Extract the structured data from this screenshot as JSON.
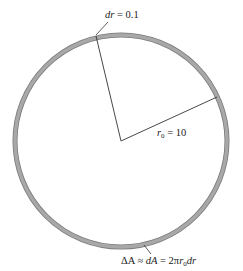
{
  "diagram": {
    "type": "annular ring (circle with thin shaded band) and two radii",
    "colors": {
      "ring_fill": "#a6a6a6",
      "ring_edge": "#7a7a7a",
      "line": "#333333",
      "background": "#ffffff"
    },
    "circle": {
      "center": [
        121,
        141
      ],
      "radius": 106,
      "ring_width": 4
    },
    "labels": {
      "dr": {
        "var": "dr",
        "eq": " = 0.1"
      },
      "r0": {
        "var": "r",
        "sub": "0",
        "eq": " = 10"
      },
      "area": {
        "delta": "ΔA",
        "approx": " ≈ ",
        "dA": "dA",
        "eq": " = 2π",
        "r": "r",
        "sub": "0",
        "dr": "dr"
      }
    }
  }
}
